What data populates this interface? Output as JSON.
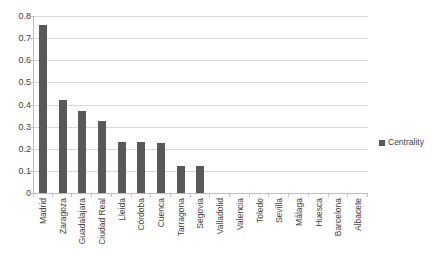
{
  "chart_data": {
    "type": "bar",
    "title": "",
    "xlabel": "",
    "ylabel": "",
    "ylim": [
      0,
      0.8
    ],
    "ytick_labels": [
      "0.8",
      "0.7",
      "0.6",
      "0.5",
      "0.4",
      "0.3",
      "0.2",
      "0.1",
      "0"
    ],
    "ytick_values": [
      0.8,
      0.7,
      0.6,
      0.5,
      0.4,
      0.3,
      0.2,
      0.1,
      0
    ],
    "grid": true,
    "legend_position": "right",
    "legend": [
      "Centrality"
    ],
    "categories": [
      "Madrid",
      "Zaragoza",
      "Guadalajara",
      "Ciudad Real",
      "Lleida",
      "Córdoba",
      "Cuenca",
      "Tarragona",
      "Segovia",
      "Valladolid",
      "Valencia",
      "Toledo",
      "Sevilla",
      "Málaga",
      "Huesca",
      "Barcelona",
      "Albacete"
    ],
    "series": [
      {
        "name": "Centrality",
        "color": "#595959",
        "values": [
          0.76,
          0.42,
          0.37,
          0.325,
          0.23,
          0.23,
          0.225,
          0.12,
          0.12,
          0,
          0,
          0,
          0,
          0,
          0,
          0,
          0
        ]
      }
    ]
  },
  "legend": {
    "entries": [
      {
        "label": "Centrality",
        "color": "#595959"
      }
    ]
  },
  "colors": {
    "bar": "#595959",
    "gridline": "#d9d9d9",
    "axis": "#bfbfbf",
    "text": "#3f3f3f",
    "background": "#ffffff"
  }
}
